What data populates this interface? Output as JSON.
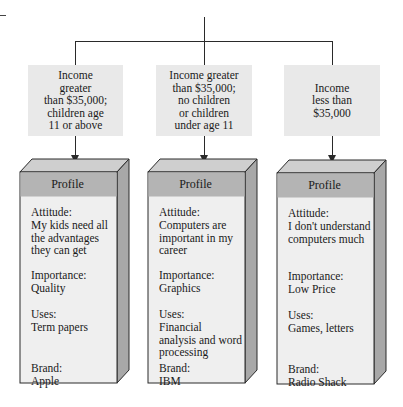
{
  "diagram": {
    "segments": [
      {
        "label": "Income\ngreater\nthan $35,000;\nchildren age\n11 or above",
        "profile": {
          "header": "Profile",
          "attitude_label": "Attitude:",
          "attitude": "My kids need all\nthe advantages\nthey can get",
          "importance_label": "Importance:",
          "importance": "Quality",
          "uses_label": "Uses:",
          "uses": "Term papers",
          "brand_label": "Brand:",
          "brand": "Apple"
        }
      },
      {
        "label": "Income greater\nthan $35,000;\nno children\nor children\nunder age 11",
        "profile": {
          "header": "Profile",
          "attitude_label": "Attitude:",
          "attitude": "Computers are\nimportant in my\ncareer",
          "importance_label": "Importance:",
          "importance": "Graphics",
          "uses_label": "Uses:",
          "uses": "Financial\nanalysis and word\nprocessing",
          "brand_label": "Brand:",
          "brand": "IBM"
        }
      },
      {
        "label": "Income\nless than\n$35,000",
        "profile": {
          "header": "Profile",
          "attitude_label": "Attitude:",
          "attitude": "I don't understand\ncomputers much",
          "importance_label": "Importance:",
          "importance": "Low Price",
          "uses_label": "Uses:",
          "uses": "Games, letters",
          "brand_label": "Brand:",
          "brand": "Radio Shack"
        }
      }
    ],
    "colors": {
      "segment_box": "#e9e9e9",
      "profile_header": "#b4b4b4",
      "profile_body": "#efefef",
      "profile_top": "#cfcfcf",
      "profile_side": "#a8a8a8",
      "line": "#2a2a2a"
    }
  }
}
